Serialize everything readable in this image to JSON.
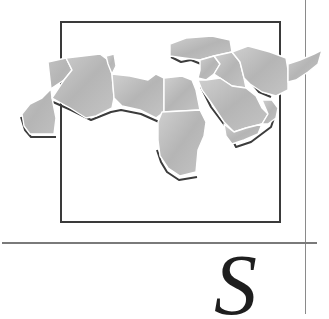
{
  "page": {
    "drop_cap": "S",
    "illustration": {
      "subject": "map of North Africa and the Middle East",
      "regions": [
        "Morocco/Western Sahara",
        "Algeria",
        "Tunisia",
        "Libya",
        "Egypt",
        "Sudan",
        "Turkey",
        "Syria",
        "Iraq",
        "Iran",
        "Jordan",
        "Saudi Arabia",
        "Yemen",
        "Oman",
        "Afghanistan"
      ]
    },
    "colors": {
      "land": "#b9b9b9",
      "border": "#ffffff",
      "shadow": "#3c3c3c",
      "frame": "#3a3a3a",
      "rule": "#7a7a7a"
    }
  }
}
